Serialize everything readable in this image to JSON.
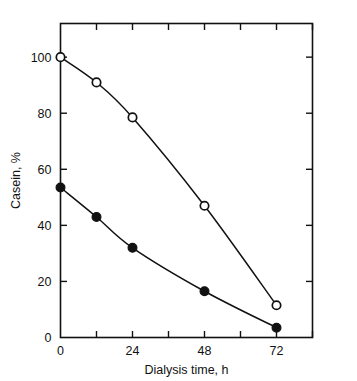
{
  "figure": {
    "background_color": "#ffffff",
    "ink_color": "#111111"
  },
  "chart_data": {
    "type": "line",
    "title": "",
    "subtitle": "",
    "xlabel": "Dialysis time, h",
    "ylabel": "Casein, %",
    "xlim": [
      0,
      84
    ],
    "ylim": [
      0,
      112
    ],
    "grid": false,
    "legend": null,
    "legend_position": "none",
    "frame": "full-box",
    "tick_direction": "in",
    "x_tick_labels": [
      "0",
      "24",
      "48",
      "72"
    ],
    "x_tick_values": [
      0,
      24,
      48,
      72
    ],
    "x_minor_tick_values": [
      12,
      36,
      60,
      84
    ],
    "y_tick_labels": [
      "0",
      "20",
      "40",
      "60",
      "80",
      "100"
    ],
    "y_tick_values": [
      0,
      20,
      40,
      60,
      80,
      100
    ],
    "series": [
      {
        "name": "open-circle-series",
        "marker": "open-circle",
        "marker_fill": "#ffffff",
        "marker_edge": "#111111",
        "line_color": "#111111",
        "x": [
          0,
          12,
          24,
          48,
          72
        ],
        "values": [
          100,
          91,
          78.5,
          47,
          11.5
        ]
      },
      {
        "name": "filled-circle-series",
        "marker": "filled-circle",
        "marker_fill": "#111111",
        "marker_edge": "#111111",
        "line_color": "#111111",
        "x": [
          0,
          12,
          24,
          48,
          72
        ],
        "values": [
          53.5,
          43,
          32,
          16.5,
          3.5
        ]
      }
    ]
  }
}
